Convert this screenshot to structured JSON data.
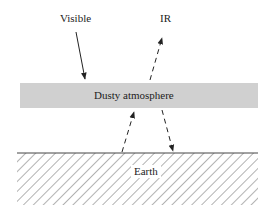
{
  "diagram": {
    "labels": {
      "visible": "Visible",
      "ir": "IR",
      "atmosphere": "Dusty atmosphere",
      "earth": "Earth"
    },
    "colors": {
      "atmosphere_fill": "#d0d0d0",
      "line": "#222222",
      "hatch": "#555555",
      "background": "#ffffff"
    }
  }
}
